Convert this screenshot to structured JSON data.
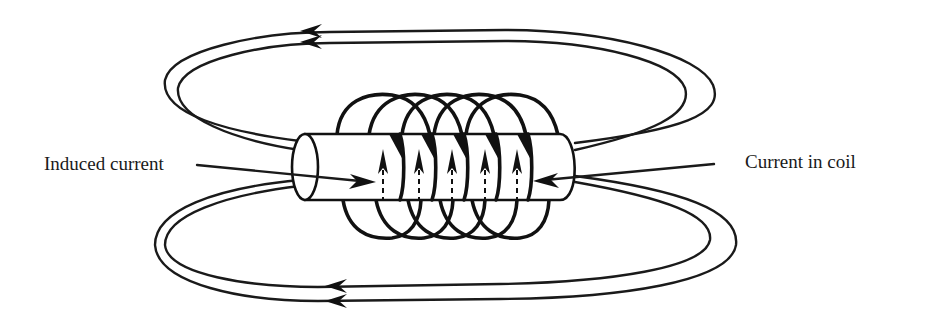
{
  "diagram": {
    "labels": {
      "induced_current": "Induced current",
      "current_in_coil": "Current in coil"
    },
    "coil": {
      "turns": 5,
      "current_direction": "up (arrows pointing upward inside each turn)"
    },
    "field_lines": {
      "upper_loop_count": 2,
      "lower_loop_count": 2,
      "direction": "leftward along top and bottom"
    },
    "colors": {
      "ink": "#111111",
      "background": "#ffffff"
    }
  }
}
